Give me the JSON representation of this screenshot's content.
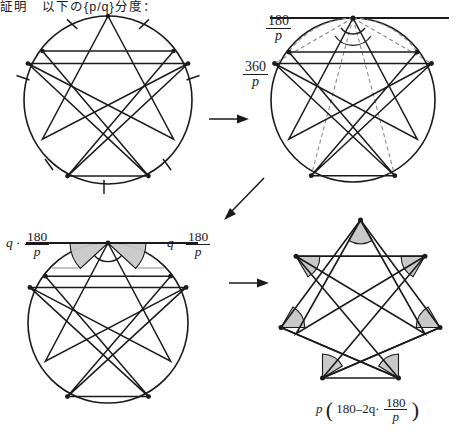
{
  "header": {
    "text": "証明　以下の{p/q}分度："
  },
  "labels": {
    "d2_half_angle_num": "180",
    "d2_half_angle_den": "p",
    "d2_central_angle_num": "360",
    "d2_central_angle_den": "p",
    "d3_left_prefix": "q ·",
    "d3_left_num": "180",
    "d3_left_den": "p",
    "d3_right_prefix": "q ·",
    "d3_right_num": "180",
    "d3_right_den": "p",
    "d4_formula_p": "p",
    "d4_formula_open": "(",
    "d4_formula_body": "180–2q·",
    "d4_formula_num": "180",
    "d4_formula_den": "p",
    "d4_formula_close": ")"
  },
  "diagrams": {
    "d1": {
      "name": "heptagram-with-equal-arc-ticks",
      "p": 7,
      "q": 2,
      "has_circle": true,
      "has_ticks": true,
      "has_vertices": true
    },
    "d2": {
      "name": "heptagram-with-tangent-and-inscribed-angles",
      "p": 7,
      "q": 2,
      "has_circle": true,
      "has_tangent": true,
      "has_dashed_radii": true,
      "has_angle_arc": true
    },
    "d3": {
      "name": "heptagram-with-shaded-tangent-chord-angles",
      "p": 7,
      "q": 2,
      "has_circle": true,
      "has_tangent": true,
      "has_shaded_wedges": true
    },
    "d4": {
      "name": "heptagram-with-shaded-point-angles",
      "p": 7,
      "q": 2,
      "has_circle": false,
      "has_shaded_wedges": true
    }
  },
  "arrows": {
    "a1": "arrow-right",
    "a2": "arrow-down-left",
    "a3": "arrow-right"
  },
  "colors": {
    "stroke": "#1a1a1a",
    "shade_fill": "#c9c9c9",
    "dash": "#8a8a8a",
    "background": "#ffffff"
  }
}
